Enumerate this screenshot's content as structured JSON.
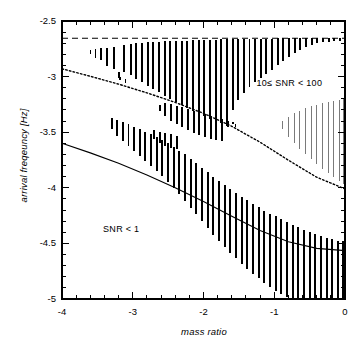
{
  "chart_data": {
    "type": "bar",
    "title": "",
    "subtitle": "",
    "xlabel": "mass ratio",
    "ylabel": "arrival freqeuncy [Hz]",
    "xlim": [
      -4,
      0
    ],
    "ylim": [
      -5,
      -2.5
    ],
    "xticks": [
      -4,
      -3,
      -2,
      -1,
      0
    ],
    "xtick_labels": [
      "-4",
      "-3",
      "-2",
      "-1",
      "0"
    ],
    "yticks": [
      -2.5,
      -3,
      -3.5,
      -4,
      -4.5,
      -5
    ],
    "ytick_labels": [
      "-2.5",
      "-3",
      "-3.5",
      "-4",
      "-4.5",
      "-5"
    ],
    "x_minor_ticks_per_major": 5,
    "y_minor_ticks_per_major": 5,
    "grid": false,
    "legend": "none",
    "frame": "box",
    "annotations": [
      {
        "text": "10≤ SNR < 100",
        "x": -1.25,
        "y": -3.07
      },
      {
        "text": "SNR < 1",
        "x": -3.42,
        "y": -4.38
      }
    ],
    "curves": [
      {
        "name": "upper-bound-dashed",
        "style": "dashed",
        "color": "#000000",
        "x": [
          -4.0,
          -3.0,
          -2.0,
          -1.0,
          0.0
        ],
        "y": [
          -2.655,
          -2.655,
          -2.655,
          -2.655,
          -2.655
        ]
      },
      {
        "name": "snr-10-boundary-dotted",
        "style": "dotted",
        "color": "#000000",
        "x": [
          -4.0,
          -3.6,
          -3.2,
          -2.8,
          -2.4,
          -2.0,
          -1.6,
          -1.2,
          -0.8,
          -0.4,
          0.0
        ],
        "y": [
          -2.93,
          -2.997,
          -3.068,
          -3.146,
          -3.232,
          -3.33,
          -3.447,
          -3.59,
          -3.752,
          -3.905,
          -4.01
        ]
      },
      {
        "name": "snr-1-boundary-solid",
        "style": "solid",
        "color": "#000000",
        "x": [
          -4.0,
          -3.6,
          -3.2,
          -2.8,
          -2.4,
          -2.0,
          -1.6,
          -1.2,
          -0.8,
          -0.4,
          0.0
        ],
        "y": [
          -3.6,
          -3.686,
          -3.78,
          -3.884,
          -3.999,
          -4.124,
          -4.256,
          -4.385,
          -4.486,
          -4.545,
          -4.565
        ]
      }
    ],
    "series": [
      {
        "name": "SNR >= 100 bars",
        "description": "thick black vertical bars from dashed upper bound down toward the dotted SNR=10 boundary",
        "color": "#000000",
        "bar_width": 0.028,
        "bars": [
          {
            "x": -3.45,
            "y0": -2.745,
            "y1": -2.855
          },
          {
            "x": -3.36,
            "y0": -2.745,
            "y1": -2.905
          },
          {
            "x": -3.27,
            "y0": -2.73,
            "y1": -2.93
          },
          {
            "x": -3.2,
            "y0": -2.96,
            "y1": -3.015
          },
          {
            "x": -3.12,
            "y0": -2.72,
            "y1": -2.955
          },
          {
            "x": -3.03,
            "y0": -2.705,
            "y1": -2.99
          },
          {
            "x": -2.95,
            "y0": -2.7,
            "y1": -3.02
          },
          {
            "x": -2.87,
            "y0": -2.695,
            "y1": -3.05
          },
          {
            "x": -2.79,
            "y0": -2.69,
            "y1": -3.08
          },
          {
            "x": -2.71,
            "y0": -2.688,
            "y1": -3.11
          },
          {
            "x": -2.63,
            "y0": -2.686,
            "y1": -3.14
          },
          {
            "x": -2.55,
            "y0": -2.684,
            "y1": -3.17
          },
          {
            "x": -2.47,
            "y0": -2.682,
            "y1": -3.2
          },
          {
            "x": -2.39,
            "y0": -2.68,
            "y1": -3.23
          },
          {
            "x": -2.31,
            "y0": -2.678,
            "y1": -3.255
          },
          {
            "x": -2.23,
            "y0": -2.676,
            "y1": -3.28
          },
          {
            "x": -2.15,
            "y0": -2.674,
            "y1": -3.305
          },
          {
            "x": -2.07,
            "y0": -2.672,
            "y1": -3.33
          },
          {
            "x": -1.99,
            "y0": -2.67,
            "y1": -3.355
          },
          {
            "x": -1.91,
            "y0": -2.668,
            "y1": -3.38
          },
          {
            "x": -1.83,
            "y0": -2.667,
            "y1": -3.4
          },
          {
            "x": -1.75,
            "y0": -2.666,
            "y1": -3.42
          },
          {
            "x": -1.67,
            "y0": -2.665,
            "y1": -3.44
          },
          {
            "x": -1.59,
            "y0": -2.664,
            "y1": -3.3
          },
          {
            "x": -1.51,
            "y0": -2.663,
            "y1": -3.21
          },
          {
            "x": -1.43,
            "y0": -2.662,
            "y1": -3.145
          },
          {
            "x": -1.35,
            "y0": -2.661,
            "y1": -3.095
          },
          {
            "x": -1.27,
            "y0": -2.66,
            "y1": -3.05
          },
          {
            "x": -1.19,
            "y0": -2.659,
            "y1": -3.01
          },
          {
            "x": -1.11,
            "y0": -2.658,
            "y1": -2.975
          },
          {
            "x": -1.03,
            "y0": -2.658,
            "y1": -2.94
          },
          {
            "x": -0.95,
            "y0": -2.657,
            "y1": -2.9
          },
          {
            "x": -0.87,
            "y0": -2.657,
            "y1": -2.86
          },
          {
            "x": -0.79,
            "y0": -2.656,
            "y1": -2.82
          },
          {
            "x": -0.71,
            "y0": -2.656,
            "y1": -2.79
          },
          {
            "x": -0.63,
            "y0": -2.656,
            "y1": -2.76
          },
          {
            "x": -0.55,
            "y0": -2.655,
            "y1": -2.735
          },
          {
            "x": -0.47,
            "y0": -2.655,
            "y1": -2.715
          },
          {
            "x": -0.39,
            "y0": -2.655,
            "y1": -2.7
          },
          {
            "x": -0.31,
            "y0": -2.655,
            "y1": -2.692
          },
          {
            "x": -0.23,
            "y0": -2.655,
            "y1": -2.686
          },
          {
            "x": -0.15,
            "y0": -2.655,
            "y1": -2.682
          },
          {
            "x": -0.07,
            "y0": -2.655,
            "y1": -2.678
          }
        ]
      },
      {
        "name": "mid-cluster bars",
        "description": "short thick bars near the dotted SNR=10 boundary around mass ratio -2.6 to -1.5",
        "color": "#000000",
        "bar_width": 0.028,
        "bars": [
          {
            "x": -2.62,
            "y0": -3.255,
            "y1": -3.31
          },
          {
            "x": -2.54,
            "y0": -3.235,
            "y1": -3.35
          },
          {
            "x": -2.46,
            "y0": -3.245,
            "y1": -3.395
          },
          {
            "x": -2.38,
            "y0": -3.26,
            "y1": -3.43
          },
          {
            "x": -2.3,
            "y0": -3.275,
            "y1": -3.455
          },
          {
            "x": -2.22,
            "y0": -3.29,
            "y1": -3.48
          },
          {
            "x": -2.14,
            "y0": -3.305,
            "y1": -3.505
          },
          {
            "x": -2.06,
            "y0": -3.32,
            "y1": -3.525
          },
          {
            "x": -1.98,
            "y0": -3.335,
            "y1": -3.545
          },
          {
            "x": -1.9,
            "y0": -3.35,
            "y1": -3.56
          },
          {
            "x": -1.82,
            "y0": -3.365,
            "y1": -3.572
          },
          {
            "x": -1.74,
            "y0": -3.38,
            "y1": -3.578
          },
          {
            "x": -1.66,
            "y0": -3.395,
            "y1": -3.45
          },
          {
            "x": -1.58,
            "y0": -3.41,
            "y1": -3.43
          },
          {
            "x": -2.7,
            "y0": -3.48,
            "y1": -3.56
          },
          {
            "x": -2.62,
            "y0": -3.5,
            "y1": -3.595
          },
          {
            "x": -2.54,
            "y0": -3.51,
            "y1": -3.62
          },
          {
            "x": -2.46,
            "y0": -3.52,
            "y1": -3.64
          },
          {
            "x": -2.38,
            "y0": -3.53,
            "y1": -3.65
          }
        ]
      },
      {
        "name": "SNR 1-10 lower bars",
        "description": "thick black bars hanging below the solid SNR=1 boundary toward the bottom axis",
        "color": "#000000",
        "bar_width": 0.028,
        "bars": [
          {
            "x": -2.1,
            "y0": -3.78,
            "y1": -4.235
          },
          {
            "x": -2.02,
            "y0": -3.82,
            "y1": -4.3
          },
          {
            "x": -1.94,
            "y0": -3.86,
            "y1": -4.36
          },
          {
            "x": -1.86,
            "y0": -3.9,
            "y1": -4.42
          },
          {
            "x": -1.78,
            "y0": -3.938,
            "y1": -4.478
          },
          {
            "x": -1.7,
            "y0": -3.975,
            "y1": -4.53
          },
          {
            "x": -1.62,
            "y0": -4.01,
            "y1": -4.585
          },
          {
            "x": -1.54,
            "y0": -4.045,
            "y1": -4.635
          },
          {
            "x": -1.46,
            "y0": -4.08,
            "y1": -4.685
          },
          {
            "x": -1.38,
            "y0": -4.112,
            "y1": -4.73
          },
          {
            "x": -1.3,
            "y0": -4.145,
            "y1": -4.775
          },
          {
            "x": -1.22,
            "y0": -4.175,
            "y1": -4.815
          },
          {
            "x": -1.14,
            "y0": -4.205,
            "y1": -4.855
          },
          {
            "x": -1.06,
            "y0": -4.232,
            "y1": -4.89
          },
          {
            "x": -0.98,
            "y0": -4.258,
            "y1": -4.925
          },
          {
            "x": -0.9,
            "y0": -4.285,
            "y1": -4.955
          },
          {
            "x": -0.82,
            "y0": -4.31,
            "y1": -4.98
          },
          {
            "x": -0.74,
            "y0": -4.332,
            "y1": -5.0
          },
          {
            "x": -0.66,
            "y0": -4.355,
            "y1": -5.0
          },
          {
            "x": -0.58,
            "y0": -4.375,
            "y1": -5.0
          },
          {
            "x": -0.5,
            "y0": -4.395,
            "y1": -5.0
          },
          {
            "x": -0.42,
            "y0": -4.415,
            "y1": -5.0
          },
          {
            "x": -0.34,
            "y0": -4.432,
            "y1": -5.0
          },
          {
            "x": -0.26,
            "y0": -4.448,
            "y1": -5.0
          },
          {
            "x": -0.18,
            "y0": -4.462,
            "y1": -5.0
          },
          {
            "x": -0.1,
            "y0": -4.474,
            "y1": -5.0
          },
          {
            "x": -0.03,
            "y0": -4.482,
            "y1": -5.0
          },
          {
            "x": -2.26,
            "y0": -3.7,
            "y1": -4.12
          },
          {
            "x": -2.18,
            "y0": -3.74,
            "y1": -4.18
          },
          {
            "x": -2.34,
            "y0": -3.665,
            "y1": -4.06
          },
          {
            "x": -2.42,
            "y0": -3.63,
            "y1": -4.0
          },
          {
            "x": -2.5,
            "y0": -3.6,
            "y1": -3.945
          },
          {
            "x": -2.58,
            "y0": -3.57,
            "y1": -3.895
          },
          {
            "x": -2.66,
            "y0": -3.545,
            "y1": -3.845
          },
          {
            "x": -2.74,
            "y0": -3.52,
            "y1": -3.8
          },
          {
            "x": -2.82,
            "y0": -3.495,
            "y1": -3.755
          },
          {
            "x": -2.9,
            "y0": -3.472,
            "y1": -3.712
          },
          {
            "x": -2.98,
            "y0": -3.45,
            "y1": -3.67
          },
          {
            "x": -3.06,
            "y0": -3.43,
            "y1": -3.625
          },
          {
            "x": -3.14,
            "y0": -3.412,
            "y1": -3.58
          },
          {
            "x": -3.22,
            "y0": -3.392,
            "y1": -3.53
          },
          {
            "x": -3.3,
            "y0": -3.372,
            "y1": -3.47
          }
        ]
      },
      {
        "name": "SNR 10-100 thin wedge",
        "description": "thin grey vertical lines forming a wedge above the dotted boundary near mass ratio -1 to 0",
        "color": "#7a7a7a",
        "bar_width": 0.007,
        "bars": [
          {
            "x": -0.88,
            "y0": -3.4,
            "y1": -3.47
          },
          {
            "x": -0.8,
            "y0": -3.36,
            "y1": -3.54
          },
          {
            "x": -0.72,
            "y0": -3.33,
            "y1": -3.6
          },
          {
            "x": -0.64,
            "y0": -3.305,
            "y1": -3.65
          },
          {
            "x": -0.56,
            "y0": -3.285,
            "y1": -3.7
          },
          {
            "x": -0.48,
            "y0": -3.268,
            "y1": -3.745
          },
          {
            "x": -0.4,
            "y0": -3.252,
            "y1": -3.79
          },
          {
            "x": -0.32,
            "y0": -3.238,
            "y1": -3.83
          },
          {
            "x": -0.24,
            "y0": -3.226,
            "y1": -3.87
          },
          {
            "x": -0.16,
            "y0": -3.216,
            "y1": -3.905
          },
          {
            "x": -0.08,
            "y0": -3.208,
            "y1": -3.94
          },
          {
            "x": -0.02,
            "y0": -3.202,
            "y1": -3.97
          }
        ]
      },
      {
        "name": "upper dotted marker bars",
        "description": "short square markers along the dashed upper bound at the right end",
        "color": "#000000",
        "bar_width": 0.018,
        "bars": [
          {
            "x": -3.6,
            "y0": -2.76,
            "y1": -2.8
          },
          {
            "x": -3.53,
            "y0": -2.75,
            "y1": -2.83
          },
          {
            "x": -3.18,
            "y0": -3.0,
            "y1": -3.03
          },
          {
            "x": -3.1,
            "y0": -3.025,
            "y1": -3.06
          },
          {
            "x": -1.55,
            "y0": -3.43,
            "y1": -3.455
          }
        ]
      }
    ]
  }
}
